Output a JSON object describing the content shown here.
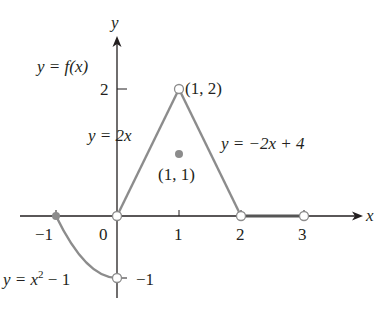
{
  "figure": {
    "function_label": "y = f(x)",
    "axes": {
      "x_label": "x",
      "y_label": "y",
      "x_ticks": [
        {
          "value": -1,
          "label": "−1"
        },
        {
          "value": 0,
          "label": "0"
        },
        {
          "value": 1,
          "label": "1"
        },
        {
          "value": 2,
          "label": "2"
        },
        {
          "value": 3,
          "label": "3"
        }
      ],
      "y_ticks": [
        {
          "value": 2,
          "label": "2"
        },
        {
          "value": -1,
          "label": "−1"
        }
      ]
    },
    "pieces": [
      {
        "name": "parabola",
        "equation": "y = x² − 1",
        "eq_main": "y = x",
        "eq_sup": "2",
        "eq_tail": " − 1",
        "domain": "-1 <= x < 0"
      },
      {
        "name": "rising-line",
        "equation": "y = 2x",
        "domain": "0 < x < 1"
      },
      {
        "name": "falling-line",
        "equation": "y = −2x + 4",
        "domain": "1 < x < 2"
      },
      {
        "name": "zero-segment",
        "equation": "y = 0",
        "domain": "2 < x < 3"
      }
    ],
    "points": [
      {
        "label": "(1, 2)",
        "x": 1,
        "y": 2,
        "filled": false
      },
      {
        "label": "(1, 1)",
        "x": 1,
        "y": 1,
        "filled": true
      },
      {
        "label": "",
        "x": -1,
        "y": 0,
        "filled": true
      },
      {
        "label": "",
        "x": 0,
        "y": 0,
        "filled": false
      },
      {
        "label": "",
        "x": 0,
        "y": -1,
        "filled": false
      },
      {
        "label": "",
        "x": 2,
        "y": 0,
        "filled": false
      },
      {
        "label": "",
        "x": 3,
        "y": 0,
        "filled": false
      }
    ],
    "colors": {
      "curve": "#8c8c8c",
      "axis": "#231f20",
      "filled_point": "#8c8c8c",
      "text": "#231f20"
    }
  }
}
